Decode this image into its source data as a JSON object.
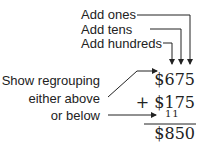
{
  "labels": {
    "add_ones": "Add ones",
    "add_tens": "Add tens",
    "add_hundreds": "Add hundreds",
    "show_regrouping": "Show regrouping",
    "either_above": "either above",
    "or_below": "or below"
  },
  "problem": {
    "addend1": "$675",
    "addend2": "+ $175",
    "carry": "11",
    "sum": "$850"
  },
  "colors": {
    "ink": "#222222",
    "background": "#ffffff"
  }
}
